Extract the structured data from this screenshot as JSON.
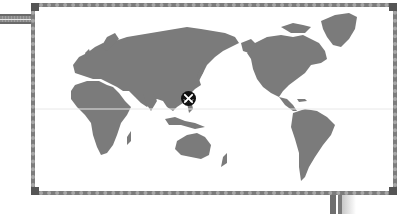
{
  "map": {
    "type": "world-map",
    "projection": "pacific-centered",
    "colors": {
      "land": "#7b7b7b",
      "ocean": "#ffffff",
      "frame": "#7c7c7c",
      "equator": "#e8e8e8",
      "marker_bg": "#111111",
      "marker_icon": "#ffffff"
    },
    "regions": [
      "Europe",
      "Africa",
      "Asia",
      "Australia",
      "North America",
      "Greenland",
      "South America"
    ],
    "marker": {
      "icon": "crossed-swords-icon",
      "location": "East Asia"
    }
  }
}
